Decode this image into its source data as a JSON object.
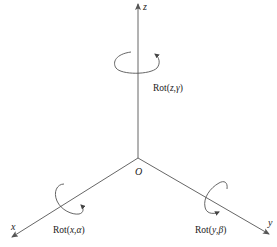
{
  "diagram": {
    "type": "3d-coordinate-frame-rotations",
    "origin": {
      "label": "O",
      "x": 138,
      "y": 158
    },
    "colors": {
      "stroke": "#555555",
      "text": "#222222",
      "background": "#ffffff"
    },
    "axes": [
      {
        "id": "z",
        "label": "z",
        "end": [
          138,
          4
        ]
      },
      {
        "id": "x",
        "label": "x",
        "end": [
          12,
          237
        ]
      },
      {
        "id": "y",
        "label": "y",
        "end": [
          269,
          234
        ]
      }
    ],
    "rotations": [
      {
        "axis": "z",
        "prefix": "Rot(",
        "axis_var": "z",
        "sep": ",",
        "angle": "γ",
        "suffix": ")"
      },
      {
        "axis": "x",
        "prefix": "Rot(",
        "axis_var": "x",
        "sep": ",",
        "angle": "α",
        "suffix": ")"
      },
      {
        "axis": "y",
        "prefix": "Rot(",
        "axis_var": "y",
        "sep": ",",
        "angle": "β",
        "suffix": ")"
      }
    ]
  }
}
